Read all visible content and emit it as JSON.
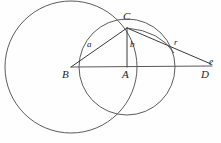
{
  "figure": {
    "type": "geometry-diagram",
    "background_color": "#fefefe",
    "stroke_color": "#3a3a3a"
  },
  "vertices": [
    {
      "id": "B",
      "label": "B",
      "x": 71,
      "y": 67,
      "label_x": 63,
      "label_y": 71
    },
    {
      "id": "A",
      "label": "A",
      "x": 127,
      "y": 67,
      "label_x": 123,
      "label_y": 71
    },
    {
      "id": "C",
      "label": "C",
      "x": 127,
      "y": 28,
      "label_x": 124,
      "label_y": 13
    },
    {
      "id": "D",
      "label": "D",
      "x": 208,
      "y": 68,
      "label_x": 202,
      "label_y": 71
    },
    {
      "id": "e",
      "label": "e",
      "x": 213,
      "y": 62,
      "label_x": 210,
      "label_y": 58
    }
  ],
  "segments": [
    {
      "id": "BC",
      "label": "a",
      "from": "B",
      "to": "C",
      "label_x": 87,
      "label_y": 40
    },
    {
      "id": "AC",
      "label": "b",
      "from": "A",
      "to": "C",
      "label_x": 130,
      "label_y": 40
    },
    {
      "id": "CD",
      "label": "r",
      "from": "C",
      "to": "D",
      "label_x": 174,
      "label_y": 39
    },
    {
      "id": "BD",
      "label": "",
      "from": "B",
      "to": "D",
      "label_x": 0,
      "label_y": 0
    }
  ],
  "circles": [
    {
      "id": "circle-B",
      "center": "B",
      "cx": 71,
      "cy": 67,
      "r": 66
    },
    {
      "id": "circle-A",
      "center": "A",
      "cx": 127,
      "cy": 67,
      "r": 48
    }
  ],
  "arc": {
    "id": "arc-CD",
    "note": "tangent arc from C curving toward the segment CD",
    "from_x": 127,
    "from_y": 28,
    "to_x": 172,
    "to_y": 52
  },
  "labels": {
    "a": "a",
    "b": "b",
    "r": "r",
    "A": "A",
    "B": "B",
    "C": "C",
    "D": "D",
    "e": "e"
  }
}
